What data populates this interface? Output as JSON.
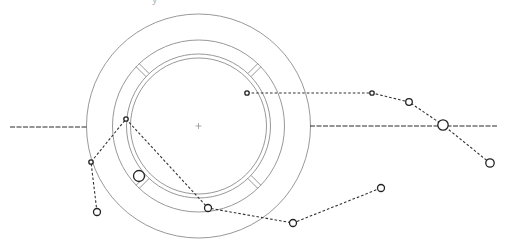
{
  "diagram": {
    "title_fragment": "y",
    "colors": {
      "geometry": "#8c8c8c",
      "axis": "#2a2a2a",
      "path": "#333333",
      "node_stroke": "#222222",
      "background": "#ffffff"
    },
    "center": {
      "x": 198.5,
      "y": 126
    },
    "rings": [
      {
        "name": "outer-circle",
        "r": 112
      },
      {
        "name": "ring-outer",
        "r": 86
      },
      {
        "name": "ring-inner-a",
        "r": 72
      },
      {
        "name": "ring-inner-b",
        "r": 68
      }
    ],
    "segment_dividers_angles_deg": [
      45,
      135,
      225,
      315
    ],
    "axis_line": {
      "left": {
        "x1": 10,
        "y1": 127,
        "x2": 88,
        "y2": 127
      },
      "right": {
        "x1": 310,
        "y1": 126,
        "x2": 497,
        "y2": 126
      }
    },
    "paths": [
      {
        "name": "path-a",
        "points": [
          [
            97,
            212
          ],
          [
            91,
            162
          ],
          [
            126,
            119
          ],
          [
            208,
            208
          ],
          [
            293,
            223
          ],
          [
            381,
            188
          ]
        ]
      },
      {
        "name": "path-b",
        "points": [
          [
            247,
            93
          ],
          [
            372,
            93
          ],
          [
            409,
            102
          ],
          [
            443,
            125
          ],
          [
            490,
            163
          ]
        ]
      }
    ],
    "nodes": [
      {
        "name": "node-1",
        "x": 97,
        "y": 212,
        "r": 3.5
      },
      {
        "name": "node-2",
        "x": 91,
        "y": 162,
        "r": 2.2
      },
      {
        "name": "node-3",
        "x": 126,
        "y": 119,
        "r": 2.2
      },
      {
        "name": "node-4",
        "x": 139,
        "y": 176,
        "r": 5.5
      },
      {
        "name": "node-5",
        "x": 208,
        "y": 208,
        "r": 3.5
      },
      {
        "name": "node-6",
        "x": 293,
        "y": 223,
        "r": 3.5
      },
      {
        "name": "node-7",
        "x": 381,
        "y": 188,
        "r": 3.5
      },
      {
        "name": "node-8",
        "x": 247,
        "y": 93,
        "r": 2.2
      },
      {
        "name": "node-9",
        "x": 372,
        "y": 93,
        "r": 2.2
      },
      {
        "name": "node-10",
        "x": 409,
        "y": 102,
        "r": 3.3
      },
      {
        "name": "node-11",
        "x": 443,
        "y": 125,
        "r": 5.2
      },
      {
        "name": "node-12",
        "x": 490,
        "y": 163,
        "r": 4.2
      }
    ]
  }
}
